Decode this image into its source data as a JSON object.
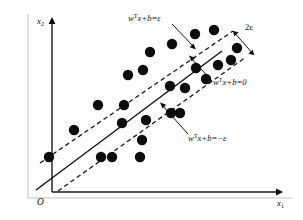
{
  "figure": {
    "kind": "support-vector-regression-diagram",
    "background_color": "#ffffff",
    "ink_color": "#111111",
    "point_color": "#0d0d0d",
    "frame_color": "#b9b9b9"
  },
  "axes": {
    "y_label_base": "x",
    "y_label_sub": "2",
    "x_label_base": "x",
    "x_label_sub": "1",
    "origin_label": "O",
    "x_axis_from": [
      52,
      192
    ],
    "x_axis_to": [
      278,
      192
    ],
    "y_axis_from": [
      52,
      192
    ],
    "y_axis_to": [
      52,
      21
    ]
  },
  "lines": {
    "upper_margin": {
      "label_base": "w",
      "label_sup": "T",
      "label_rest": "x+b=ε",
      "text_x": 128,
      "text_y": 21,
      "p1": [
        40,
        163
      ],
      "p2": [
        233,
        31
      ]
    },
    "regression": {
      "label_base": "w",
      "label_sup": "T",
      "label_rest": "x+b=0",
      "text_x": 213,
      "text_y": 85,
      "p1": [
        36,
        190
      ],
      "p2": [
        222,
        51
      ]
    },
    "lower_margin": {
      "label_base": "w",
      "label_sup": "T",
      "label_rest": "x+b=−ε",
      "text_x": 190,
      "text_y": 140,
      "p1": [
        58,
        191
      ],
      "p2": [
        246,
        57
      ]
    },
    "margin_width": {
      "label": "2ε",
      "text_x": 245,
      "text_y": 29
    }
  },
  "leaders": [
    {
      "name": "upper-margin-leader",
      "from": [
        172,
        24
      ],
      "to": [
        196,
        48
      ]
    },
    {
      "name": "regression-leader",
      "from": [
        211,
        81
      ],
      "to": [
        190,
        57
      ]
    },
    {
      "name": "lower-margin-leader",
      "from": [
        188,
        134
      ],
      "to": [
        160,
        103
      ]
    }
  ],
  "chart_data": {
    "type": "scatter",
    "title": "",
    "xlabel": "x1",
    "ylabel": "x2",
    "grid": false,
    "legend": "none",
    "xlim": [
      0,
      303
    ],
    "ylim": [
      0,
      220
    ],
    "point_radius": 5.2,
    "point_count": 25,
    "points": [
      [
        49,
        157
      ],
      [
        74,
        130
      ],
      [
        98,
        105
      ],
      [
        101,
        157
      ],
      [
        112,
        157
      ],
      [
        122,
        123
      ],
      [
        124,
        105
      ],
      [
        128,
        75
      ],
      [
        140,
        157
      ],
      [
        142,
        140
      ],
      [
        143,
        70
      ],
      [
        146,
        120
      ],
      [
        150,
        52
      ],
      [
        171,
        113
      ],
      [
        180,
        113
      ],
      [
        170,
        86
      ],
      [
        185,
        88
      ],
      [
        172,
        44
      ],
      [
        195,
        34
      ],
      [
        196,
        68
      ],
      [
        206,
        79
      ],
      [
        214,
        30
      ],
      [
        218,
        65
      ],
      [
        231,
        60
      ],
      [
        237,
        48
      ]
    ]
  },
  "caption": {
    "text": ""
  }
}
